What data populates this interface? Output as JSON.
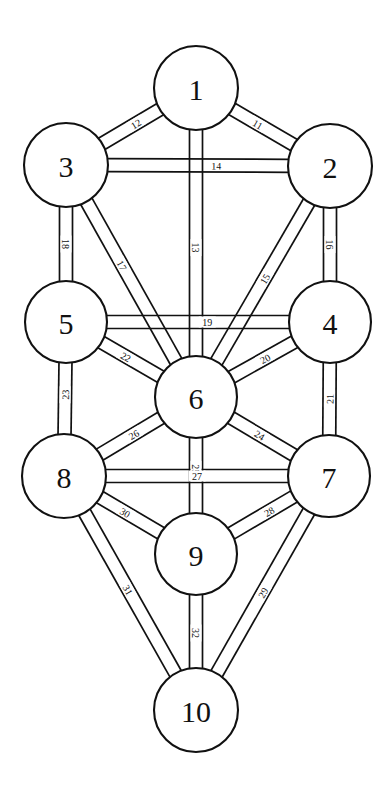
{
  "diagram": {
    "background_color": "#ffffff",
    "stroke_color": "#111111",
    "fill_color": "#ffffff",
    "width": 388,
    "height": 791,
    "sephiroth": [
      {
        "id": "s1",
        "label": "1",
        "cx": 196,
        "cy": 88,
        "r": 42
      },
      {
        "id": "s2",
        "label": "2",
        "cx": 330,
        "cy": 166,
        "r": 42
      },
      {
        "id": "s3",
        "label": "3",
        "cx": 66,
        "cy": 165,
        "r": 42
      },
      {
        "id": "s4",
        "label": "4",
        "cx": 330,
        "cy": 322,
        "r": 41
      },
      {
        "id": "s5",
        "label": "5",
        "cx": 66,
        "cy": 322,
        "r": 41
      },
      {
        "id": "s6",
        "label": "6",
        "cx": 196,
        "cy": 397,
        "r": 41
      },
      {
        "id": "s7",
        "label": "7",
        "cx": 329,
        "cy": 476,
        "r": 41
      },
      {
        "id": "s8",
        "label": "8",
        "cx": 64,
        "cy": 476,
        "r": 42
      },
      {
        "id": "s9",
        "label": "9",
        "cx": 196,
        "cy": 554,
        "r": 41
      },
      {
        "id": "s10",
        "label": "10",
        "cx": 196,
        "cy": 710,
        "r": 42
      }
    ],
    "paths": [
      {
        "label": "11",
        "from": "s1",
        "to": "s2",
        "width": 13,
        "label_pos": 0.42,
        "label_side": 1
      },
      {
        "label": "12",
        "from": "s1",
        "to": "s3",
        "width": 13,
        "label_pos": 0.42,
        "label_side": 1
      },
      {
        "label": "13",
        "from": "s1",
        "to": "s6",
        "width": 13,
        "label_pos": 0.52,
        "label_side": 0
      },
      {
        "label": "14",
        "from": "s3",
        "to": "s2",
        "width": 13,
        "label_pos": 0.6,
        "label_side": 0
      },
      {
        "label": "15",
        "from": "s2",
        "to": "s6",
        "width": 13,
        "label_pos": 0.48,
        "label_side": 0
      },
      {
        "label": "16",
        "from": "s2",
        "to": "s4",
        "width": 13,
        "label_pos": 0.5,
        "label_side": 0
      },
      {
        "label": "17",
        "from": "s3",
        "to": "s6",
        "width": 13,
        "label_pos": 0.4,
        "label_side": 0
      },
      {
        "label": "18",
        "from": "s3",
        "to": "s5",
        "width": 13,
        "label_pos": 0.5,
        "label_side": 0
      },
      {
        "label": "19",
        "from": "s5",
        "to": "s4",
        "width": 13,
        "label_pos": 0.55,
        "label_side": 0
      },
      {
        "label": "20",
        "from": "s4",
        "to": "s6",
        "width": 13,
        "label_pos": 0.47,
        "label_side": 0
      },
      {
        "label": "21",
        "from": "s4",
        "to": "s7",
        "width": 13,
        "label_pos": 0.5,
        "label_side": 0
      },
      {
        "label": "22",
        "from": "s5",
        "to": "s6",
        "width": 13,
        "label_pos": 0.42,
        "label_side": 0
      },
      {
        "label": "23",
        "from": "s5",
        "to": "s8",
        "width": 13,
        "label_pos": 0.45,
        "label_side": 0
      },
      {
        "label": "24",
        "from": "s6",
        "to": "s7",
        "width": 13,
        "label_pos": 0.46,
        "label_side": 0
      },
      {
        "label": "25",
        "from": "s6",
        "to": "s9",
        "width": 13,
        "label_pos": 0.42,
        "label_side": 0
      },
      {
        "label": "26",
        "from": "s6",
        "to": "s8",
        "width": 13,
        "label_pos": 0.45,
        "label_side": 0
      },
      {
        "label": "27",
        "from": "s8",
        "to": "s7",
        "width": 13,
        "label_pos": 0.5,
        "label_side": 0
      },
      {
        "label": "28",
        "from": "s7",
        "to": "s9",
        "width": 13,
        "label_pos": 0.4,
        "label_side": 0
      },
      {
        "label": "29",
        "from": "s7",
        "to": "s10",
        "width": 13,
        "label_pos": 0.5,
        "label_side": 0
      },
      {
        "label": "30",
        "from": "s8",
        "to": "s9",
        "width": 13,
        "label_pos": 0.42,
        "label_side": 0
      },
      {
        "label": "31",
        "from": "s8",
        "to": "s10",
        "width": 13,
        "label_pos": 0.48,
        "label_side": 0
      },
      {
        "label": "32",
        "from": "s9",
        "to": "s10",
        "width": 13,
        "label_pos": 0.52,
        "label_side": 0
      }
    ]
  }
}
